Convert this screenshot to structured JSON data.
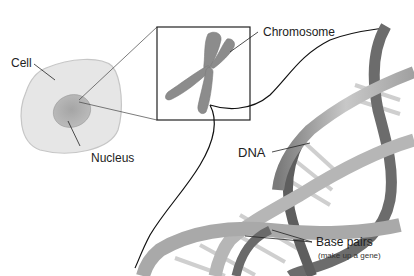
{
  "diagram": {
    "type": "biology-illustration",
    "labels": {
      "cell": "Cell",
      "nucleus": "Nucleus",
      "chromosome": "Chromosome",
      "dna": "DNA",
      "base_pairs": "Base pairs",
      "base_pairs_note": "(make up a gene)"
    },
    "colors": {
      "cell_fill": "#e6e6e6",
      "cell_stroke": "#c4c4c4",
      "nucleus_fill": "#b0b0b0",
      "chromosome_fill": "#8a8a8a",
      "helix_dark": "#6e6e6e",
      "helix_light": "#b9b9b9",
      "base_pair": "#cfcfcf",
      "line": "#222222"
    }
  }
}
